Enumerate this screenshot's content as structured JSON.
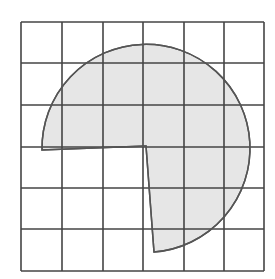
{
  "figure": {
    "grid": {
      "rows": 6,
      "cols": 6,
      "origin": [
        21,
        22
      ],
      "cell": 40.6,
      "line_color": "#444444"
    },
    "sector": {
      "center": [
        146,
        146
      ],
      "radius": 104,
      "start_point": [
        42,
        150
      ],
      "end_point": [
        154,
        252
      ],
      "fill": "#e6e6e6",
      "stroke": "#555555"
    }
  }
}
